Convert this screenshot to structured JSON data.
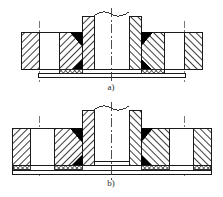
{
  "figure": {
    "kind": "engineering-drawing",
    "background_color": "#ffffff",
    "line_color": "#1a1a1a",
    "weld_color": "#000000",
    "hatch_color": "#303030",
    "gasket_color": "#4a4a4a"
  },
  "views": [
    {
      "id": "view-a",
      "label": "a)",
      "caption_label": "a)",
      "name": "welding-neck-flange-section",
      "parts": [
        {
          "name": "flange-ring-left",
          "hatch": "diagonal-45"
        },
        {
          "name": "flange-ring-right",
          "hatch": "diagonal-135"
        },
        {
          "name": "hub-left",
          "hatch": "diagonal-45"
        },
        {
          "name": "hub-right",
          "hatch": "diagonal-135"
        },
        {
          "name": "weld-fillet-upper-left",
          "fill": "solid-black"
        },
        {
          "name": "weld-fillet-upper-right",
          "fill": "solid-black"
        },
        {
          "name": "weld-fillet-lower-left",
          "fill": "solid-black"
        },
        {
          "name": "weld-fillet-lower-right",
          "fill": "solid-black"
        },
        {
          "name": "gasket-left",
          "hatch": "cross-mesh"
        },
        {
          "name": "gasket-right",
          "hatch": "cross-mesh"
        },
        {
          "name": "pipe-bore",
          "fill": "none"
        },
        {
          "name": "break-line-top",
          "style": "wavy"
        },
        {
          "name": "axis-centerline",
          "style": "dash-dot"
        },
        {
          "name": "bolt-centerline-left",
          "style": "dash-dot"
        },
        {
          "name": "bolt-centerline-right",
          "style": "dash-dot"
        }
      ]
    },
    {
      "id": "view-b",
      "label": "b)",
      "caption_label": "b)",
      "name": "slip-on-flange-section",
      "parts": [
        {
          "name": "flange-ring-left",
          "hatch": "diagonal-45"
        },
        {
          "name": "flange-ring-right",
          "hatch": "diagonal-135"
        },
        {
          "name": "hub-left",
          "hatch": "diagonal-45"
        },
        {
          "name": "hub-right",
          "hatch": "diagonal-135"
        },
        {
          "name": "weld-fillet-upper-left",
          "fill": "solid-black"
        },
        {
          "name": "weld-fillet-upper-right",
          "fill": "solid-black"
        },
        {
          "name": "weld-fillet-lower-left",
          "fill": "solid-black"
        },
        {
          "name": "weld-fillet-lower-right",
          "fill": "solid-black"
        },
        {
          "name": "gasket-outer-left",
          "hatch": "cross-mesh"
        },
        {
          "name": "gasket-inner-left",
          "hatch": "cross-mesh"
        },
        {
          "name": "gasket-inner-right",
          "hatch": "cross-mesh"
        },
        {
          "name": "gasket-outer-right",
          "hatch": "cross-mesh"
        },
        {
          "name": "pipe-bore",
          "fill": "none"
        },
        {
          "name": "break-line-top",
          "style": "wavy"
        },
        {
          "name": "axis-centerline",
          "style": "dash-dot"
        },
        {
          "name": "bolt-centerline-left",
          "style": "dash-dot"
        },
        {
          "name": "bolt-centerline-right",
          "style": "dash-dot"
        }
      ]
    }
  ]
}
